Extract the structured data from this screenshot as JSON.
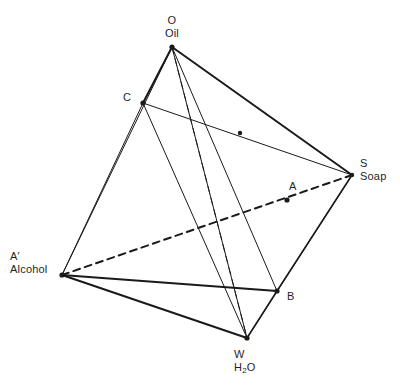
{
  "figure": {
    "type": "tetrahedron-phase-diagram",
    "background_color": "#ffffff",
    "line_color": "#1a1a1a"
  },
  "vertices": [
    {
      "id": "O",
      "symbol": "O",
      "name": "Oil",
      "x": 172,
      "y": 47,
      "label_x": 172,
      "label_y": 14,
      "align": "center"
    },
    {
      "id": "C",
      "symbol": "C",
      "name": "",
      "x": 143,
      "y": 103,
      "label_x": 123,
      "label_y": 91,
      "align": "right"
    },
    {
      "id": "S",
      "symbol": "S",
      "name": "Soap",
      "x": 352,
      "y": 175,
      "label_x": 360,
      "label_y": 157,
      "align": "left"
    },
    {
      "id": "Ap",
      "symbol": "A′",
      "name": "Alcohol",
      "x": 62,
      "y": 275,
      "label_x": 10,
      "label_y": 250,
      "align": "left"
    },
    {
      "id": "W",
      "symbol": "W",
      "name": "H₂O",
      "x": 247,
      "y": 338,
      "label_x": 234,
      "label_y": 348,
      "align": "left"
    },
    {
      "id": "A",
      "symbol": "A",
      "name": "",
      "x": 287,
      "y": 200,
      "label_x": 289,
      "label_y": 180,
      "align": "left"
    },
    {
      "id": "B",
      "symbol": "B",
      "name": "",
      "x": 277,
      "y": 291,
      "label_x": 287,
      "label_y": 290,
      "align": "left"
    }
  ],
  "marked_points": [
    {
      "id": "A",
      "x": 287,
      "y": 200,
      "r": 2.6
    },
    {
      "id": "B",
      "x": 277,
      "y": 291,
      "r": 2.6
    },
    {
      "id": "C",
      "x": 143,
      "y": 103,
      "r": 2.6
    },
    {
      "id": "Ap",
      "x": 62,
      "y": 275,
      "r": 2.6
    },
    {
      "id": "O",
      "x": 172,
      "y": 47,
      "r": 2.6
    },
    {
      "id": "W",
      "x": 247,
      "y": 338,
      "r": 2.6
    },
    {
      "id": "S",
      "x": 352,
      "y": 175,
      "r": 2.2
    },
    {
      "id": "X",
      "x": 240,
      "y": 133,
      "r": 2.2
    }
  ],
  "edges": [
    {
      "id": "O-C",
      "from": "O",
      "to": "C",
      "style": "solid",
      "weight": 2.0
    },
    {
      "id": "O-S",
      "from": "O",
      "to": "S",
      "style": "solid",
      "weight": 2.0
    },
    {
      "id": "O-Ap",
      "from": "O",
      "to": "Ap",
      "style": "solid",
      "weight": 1.0
    },
    {
      "id": "O-W",
      "from": "O",
      "to": "W",
      "style": "solid",
      "weight": 1.0
    },
    {
      "id": "O-B",
      "from": "O",
      "to": "B",
      "style": "solid",
      "weight": 1.0
    },
    {
      "id": "O-W2",
      "from": "O",
      "to": "W",
      "style": "dashed",
      "weight": 1.0
    },
    {
      "id": "C-S",
      "from": "C",
      "to": "S",
      "style": "solid",
      "weight": 1.0
    },
    {
      "id": "C-Ap",
      "from": "C",
      "to": "Ap",
      "style": "solid",
      "weight": 1.0
    },
    {
      "id": "C-W",
      "from": "C",
      "to": "W",
      "style": "solid",
      "weight": 1.0
    },
    {
      "id": "Ap-S",
      "from": "Ap",
      "to": "S",
      "style": "dashed",
      "weight": 2.0
    },
    {
      "id": "Ap-B",
      "from": "Ap",
      "to": "B",
      "style": "solid",
      "weight": 2.0
    },
    {
      "id": "Ap-W",
      "from": "Ap",
      "to": "W",
      "style": "solid",
      "weight": 2.0
    },
    {
      "id": "B-S",
      "from": "B",
      "to": "S",
      "style": "solid",
      "weight": 1.6
    },
    {
      "id": "B-W",
      "from": "B",
      "to": "W",
      "style": "solid",
      "weight": 1.6
    },
    {
      "id": "W-S",
      "from": "W",
      "to": "S",
      "style": "solid",
      "weight": 1.0
    }
  ],
  "caption": ""
}
